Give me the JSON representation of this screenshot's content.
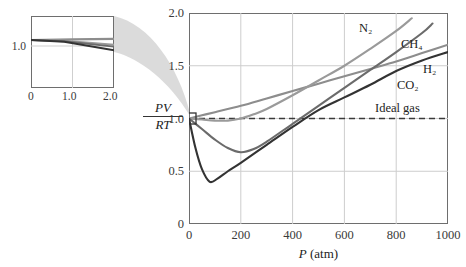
{
  "figure": {
    "yaxis_label_numerator": "PV",
    "yaxis_label_denominator": "RT",
    "xaxis_label_symbol": "P",
    "xaxis_label_unit": "(atm)",
    "ideal_gas_label": "Ideal gas"
  },
  "chart_data": {
    "type": "line",
    "title": "",
    "xlabel": "P (atm)",
    "ylabel": "PV/RT",
    "xlim": [
      0,
      1000
    ],
    "ylim": [
      0,
      2.0
    ],
    "xticks": [
      "0",
      "200",
      "400",
      "600",
      "800",
      "1000"
    ],
    "xtick_values": [
      0,
      200,
      400,
      600,
      800,
      1000
    ],
    "yticks": [
      "0",
      "0.5",
      "1.0",
      "1.5",
      "2.0"
    ],
    "ytick_values": [
      0,
      0.5,
      1.0,
      1.5,
      2.0
    ],
    "grid": true,
    "legend": "inline-labels",
    "reference_line": {
      "name": "Ideal gas",
      "value": 1.0,
      "style": "dashed"
    },
    "series": [
      {
        "name": "H2",
        "label": "H₂",
        "color": "#8d8d8d",
        "points": [
          [
            0,
            1.0
          ],
          [
            50,
            1.03
          ],
          [
            100,
            1.06
          ],
          [
            200,
            1.12
          ],
          [
            300,
            1.19
          ],
          [
            400,
            1.26
          ],
          [
            500,
            1.33
          ],
          [
            600,
            1.4
          ],
          [
            700,
            1.47
          ],
          [
            800,
            1.54
          ],
          [
            900,
            1.62
          ],
          [
            1000,
            1.7
          ]
        ]
      },
      {
        "name": "N2",
        "label": "N₂",
        "color": "#9a9a9a",
        "points": [
          [
            0,
            1.0
          ],
          [
            50,
            0.99
          ],
          [
            100,
            0.98
          ],
          [
            150,
            0.98
          ],
          [
            200,
            1.0
          ],
          [
            250,
            1.04
          ],
          [
            300,
            1.09
          ],
          [
            400,
            1.22
          ],
          [
            500,
            1.36
          ],
          [
            600,
            1.5
          ],
          [
            700,
            1.66
          ],
          [
            800,
            1.83
          ],
          [
            860,
            1.95
          ]
        ]
      },
      {
        "name": "CH4",
        "label": "CH₄",
        "color": "#6b6b6b",
        "points": [
          [
            0,
            1.0
          ],
          [
            50,
            0.9
          ],
          [
            100,
            0.8
          ],
          [
            150,
            0.72
          ],
          [
            200,
            0.68
          ],
          [
            250,
            0.71
          ],
          [
            300,
            0.78
          ],
          [
            400,
            0.95
          ],
          [
            500,
            1.12
          ],
          [
            600,
            1.29
          ],
          [
            700,
            1.46
          ],
          [
            800,
            1.63
          ],
          [
            900,
            1.81
          ],
          [
            940,
            1.9
          ]
        ]
      },
      {
        "name": "CO2",
        "label": "CO₂",
        "color": "#333333",
        "points": [
          [
            0,
            1.0
          ],
          [
            25,
            0.72
          ],
          [
            50,
            0.52
          ],
          [
            80,
            0.4
          ],
          [
            110,
            0.43
          ],
          [
            150,
            0.5
          ],
          [
            200,
            0.58
          ],
          [
            300,
            0.75
          ],
          [
            400,
            0.92
          ],
          [
            500,
            1.08
          ],
          [
            600,
            1.2
          ],
          [
            700,
            1.32
          ],
          [
            800,
            1.45
          ],
          [
            900,
            1.55
          ],
          [
            1000,
            1.63
          ]
        ]
      }
    ]
  },
  "inset": {
    "xlim": [
      0,
      2.0
    ],
    "ylim": [
      0.92,
      1.04
    ],
    "xticks": [
      "0",
      "1.0",
      "2.0"
    ],
    "xtick_values": [
      0,
      1.0,
      2.0
    ],
    "yticks": [
      "1.0"
    ],
    "ytick_values": [
      1.0
    ],
    "grid": true,
    "series": [
      {
        "name": "H2",
        "color": "#8d8d8d",
        "points": [
          [
            0,
            1.0
          ],
          [
            1.0,
            1.001
          ],
          [
            2.0,
            1.002
          ]
        ]
      },
      {
        "name": "N2",
        "color": "#9a9a9a",
        "points": [
          [
            0,
            1.0
          ],
          [
            0.8,
            0.999
          ],
          [
            2.0,
            0.992
          ]
        ]
      },
      {
        "name": "CH4",
        "color": "#6b6b6b",
        "points": [
          [
            0,
            1.0
          ],
          [
            0.8,
            0.998
          ],
          [
            2.0,
            0.989
          ]
        ]
      },
      {
        "name": "CO2",
        "color": "#333333",
        "points": [
          [
            0,
            1.0
          ],
          [
            0.8,
            0.997
          ],
          [
            2.0,
            0.983
          ]
        ]
      }
    ]
  },
  "callout": {
    "box_label": "",
    "region_description": "magnified low-pressure region near P=0, PV/RT=1"
  }
}
